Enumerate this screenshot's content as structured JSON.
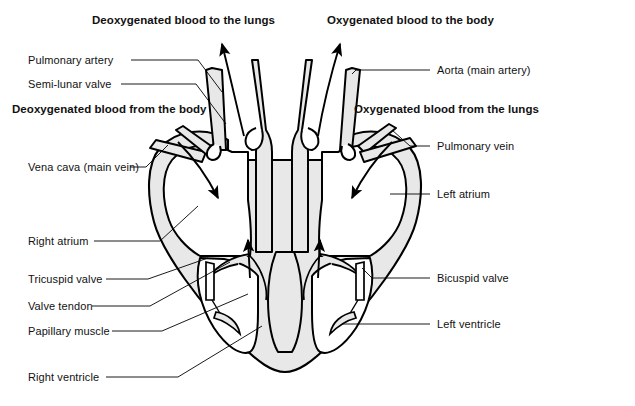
{
  "figure": {
    "background_color": "#ffffff",
    "ink_color": "#000000",
    "muscle_fill_color": "#e8e8e8",
    "chamber_fill_color": "#ffffff"
  },
  "flow_labels": [
    {
      "id": "deoxy-to-lungs",
      "text": "Deoxygenated blood to the lungs",
      "x": 92,
      "y": 14
    },
    {
      "id": "oxy-to-body",
      "text": "Oxygenated blood to the body",
      "x": 327,
      "y": 14
    },
    {
      "id": "deoxy-from-body",
      "text": "Deoxygenated blood from the body",
      "x": 12,
      "y": 103
    },
    {
      "id": "oxy-from-lungs",
      "text": "Oxygenated blood from the lungs",
      "x": 354,
      "y": 103
    }
  ],
  "part_labels": [
    {
      "id": "pulmonary-artery",
      "text": "Pulmonary artery",
      "x": 28,
      "y": 56,
      "side": "left"
    },
    {
      "id": "semi-lunar-valve",
      "text": "Semi-lunar valve",
      "x": 28,
      "y": 80,
      "side": "left"
    },
    {
      "id": "vena-cava",
      "text": "Vena cava (main vein)",
      "x": 28,
      "y": 173,
      "side": "left"
    },
    {
      "id": "right-atrium",
      "text": "Right atrium",
      "x": 28,
      "y": 238,
      "side": "left"
    },
    {
      "id": "tricuspid-valve",
      "text": "Tricuspid valve",
      "x": 28,
      "y": 276,
      "side": "left"
    },
    {
      "id": "valve-tendon",
      "text": "Valve tendon",
      "x": 28,
      "y": 303,
      "side": "left"
    },
    {
      "id": "papillary-muscle",
      "text": "Papillary muscle",
      "x": 28,
      "y": 328,
      "side": "left"
    },
    {
      "id": "right-ventricle",
      "text": "Right ventricle",
      "x": 28,
      "y": 373,
      "side": "left"
    },
    {
      "id": "aorta",
      "text": "Aorta (main artery)",
      "x": 437,
      "y": 66,
      "side": "right"
    },
    {
      "id": "pulmonary-vein",
      "text": "Pulmonary vein",
      "x": 437,
      "y": 142,
      "side": "right"
    },
    {
      "id": "left-atrium",
      "text": "Left atrium",
      "x": 437,
      "y": 190,
      "side": "right"
    },
    {
      "id": "bicuspid-valve",
      "text": "Bicuspid valve",
      "x": 437,
      "y": 274,
      "side": "right"
    },
    {
      "id": "left-ventricle",
      "text": "Left ventricle",
      "x": 437,
      "y": 320,
      "side": "right"
    }
  ],
  "flow_arrows": [
    {
      "id": "arrow-out-pulmonary-artery",
      "direction": "up-left",
      "meaning": "deoxygenated blood leaving to lungs"
    },
    {
      "id": "arrow-out-aorta",
      "direction": "up-right",
      "meaning": "oxygenated blood leaving to body"
    },
    {
      "id": "arrow-in-vena-cava",
      "direction": "down-right",
      "meaning": "deoxygenated blood entering right atrium"
    },
    {
      "id": "arrow-in-pulmonary-vein",
      "direction": "down-left",
      "meaning": "oxygenated blood entering left atrium"
    },
    {
      "id": "arrow-right-ventricle-up",
      "direction": "up",
      "meaning": "blood pumped from right ventricle"
    },
    {
      "id": "arrow-left-ventricle-up",
      "direction": "up",
      "meaning": "blood pumped from left ventricle"
    }
  ]
}
